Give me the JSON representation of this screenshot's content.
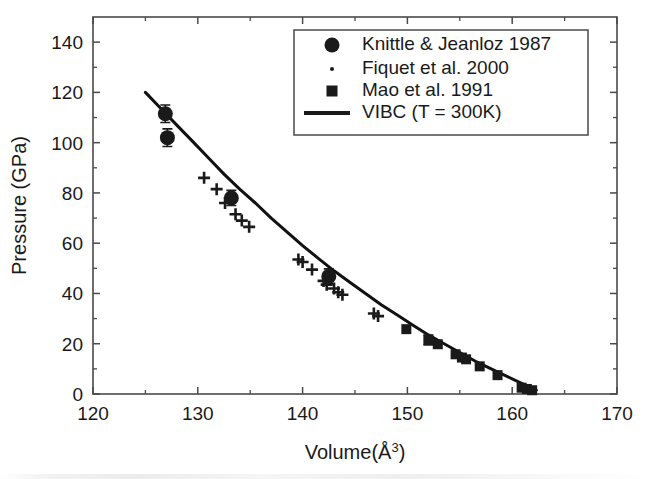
{
  "chart_data": {
    "type": "scatter",
    "title": "",
    "xlabel": "Volume(Å³)",
    "ylabel": "Pressure (GPa)",
    "xlim": [
      120,
      170
    ],
    "ylim": [
      0,
      150
    ],
    "xticks": [
      120,
      130,
      140,
      150,
      160,
      170
    ],
    "xtick_labels": [
      "120",
      "130",
      "140",
      "150",
      "160",
      "170"
    ],
    "yticks": [
      0,
      20,
      40,
      60,
      80,
      100,
      120,
      140
    ],
    "ytick_labels": [
      "0",
      "20",
      "40",
      "60",
      "80",
      "100",
      "120",
      "140"
    ],
    "x_minor_step": 5,
    "y_minor_step": 10,
    "grid": false,
    "legend_position": "top-right",
    "series": [
      {
        "name": "Knittle & Jeanloz 1987",
        "marker": "filled-circle",
        "legend_marker": "circle",
        "has_error_bars": true,
        "points": [
          {
            "x": 126.9,
            "y": 111.5,
            "yerr": 3.5
          },
          {
            "x": 127.1,
            "y": 102.0,
            "yerr": 3.5
          },
          {
            "x": 133.2,
            "y": 78.0,
            "yerr": 3.0
          },
          {
            "x": 142.5,
            "y": 46.8,
            "yerr": 3.0
          }
        ]
      },
      {
        "name": "Fiquet et al. 2000",
        "marker": "plus",
        "legend_marker": "dot",
        "has_error_bars": true,
        "points": [
          {
            "x": 130.6,
            "y": 86.0
          },
          {
            "x": 131.8,
            "y": 81.5
          },
          {
            "x": 132.6,
            "y": 76.0
          },
          {
            "x": 133.6,
            "y": 71.5
          },
          {
            "x": 134.2,
            "y": 69.0
          },
          {
            "x": 134.9,
            "y": 66.5
          },
          {
            "x": 139.6,
            "y": 53.5
          },
          {
            "x": 140.0,
            "y": 52.5
          },
          {
            "x": 140.9,
            "y": 49.5
          },
          {
            "x": 142.0,
            "y": 45.0
          },
          {
            "x": 142.3,
            "y": 43.5
          },
          {
            "x": 143.0,
            "y": 42.0
          },
          {
            "x": 143.4,
            "y": 40.5
          },
          {
            "x": 143.8,
            "y": 39.5
          },
          {
            "x": 146.8,
            "y": 32.0
          },
          {
            "x": 147.2,
            "y": 31.0
          }
        ]
      },
      {
        "name": "Mao et al. 1991",
        "marker": "filled-square",
        "legend_marker": "square",
        "has_error_bars": true,
        "points": [
          {
            "x": 149.9,
            "y": 25.8
          },
          {
            "x": 152.0,
            "y": 21.5,
            "yerr": 2.0
          },
          {
            "x": 152.9,
            "y": 19.8
          },
          {
            "x": 154.6,
            "y": 15.8
          },
          {
            "x": 155.2,
            "y": 14.5
          },
          {
            "x": 155.6,
            "y": 13.8
          },
          {
            "x": 156.9,
            "y": 11.0
          },
          {
            "x": 158.6,
            "y": 7.5
          },
          {
            "x": 160.9,
            "y": 2.5
          },
          {
            "x": 161.4,
            "y": 2.0
          },
          {
            "x": 161.9,
            "y": 1.5
          }
        ]
      }
    ],
    "curve": {
      "name": "VIBC (T = 300K)",
      "style": "solid",
      "width": 3,
      "color": "#111111",
      "points": [
        {
          "x": 125.0,
          "y": 120.0
        },
        {
          "x": 126.5,
          "y": 113.5
        },
        {
          "x": 128.0,
          "y": 107.0
        },
        {
          "x": 129.5,
          "y": 100.5
        },
        {
          "x": 131.0,
          "y": 94.0
        },
        {
          "x": 132.5,
          "y": 87.5
        },
        {
          "x": 134.0,
          "y": 81.5
        },
        {
          "x": 135.5,
          "y": 76.0
        },
        {
          "x": 137.0,
          "y": 70.0
        },
        {
          "x": 138.5,
          "y": 64.5
        },
        {
          "x": 140.0,
          "y": 59.0
        },
        {
          "x": 141.5,
          "y": 54.0
        },
        {
          "x": 143.0,
          "y": 49.0
        },
        {
          "x": 144.5,
          "y": 44.5
        },
        {
          "x": 146.0,
          "y": 40.0
        },
        {
          "x": 147.5,
          "y": 35.5
        },
        {
          "x": 149.0,
          "y": 31.5
        },
        {
          "x": 150.5,
          "y": 27.5
        },
        {
          "x": 152.0,
          "y": 23.5
        },
        {
          "x": 153.5,
          "y": 20.0
        },
        {
          "x": 155.0,
          "y": 16.5
        },
        {
          "x": 156.5,
          "y": 13.0
        },
        {
          "x": 158.0,
          "y": 10.0
        },
        {
          "x": 159.5,
          "y": 7.0
        },
        {
          "x": 161.0,
          "y": 4.0
        },
        {
          "x": 162.3,
          "y": 1.5
        }
      ]
    },
    "legend_entries": [
      {
        "label": "Knittle & Jeanloz 1987",
        "marker": "circle"
      },
      {
        "label": "Fiquet et al. 2000",
        "marker": "dot"
      },
      {
        "label": "Mao et al. 1991",
        "marker": "square"
      },
      {
        "label": "VIBC (T = 300K)",
        "marker": "line"
      }
    ],
    "colors": {
      "ink": "#1a1a1a",
      "axis": "#4a4a4a",
      "background": "#ffffff"
    }
  }
}
